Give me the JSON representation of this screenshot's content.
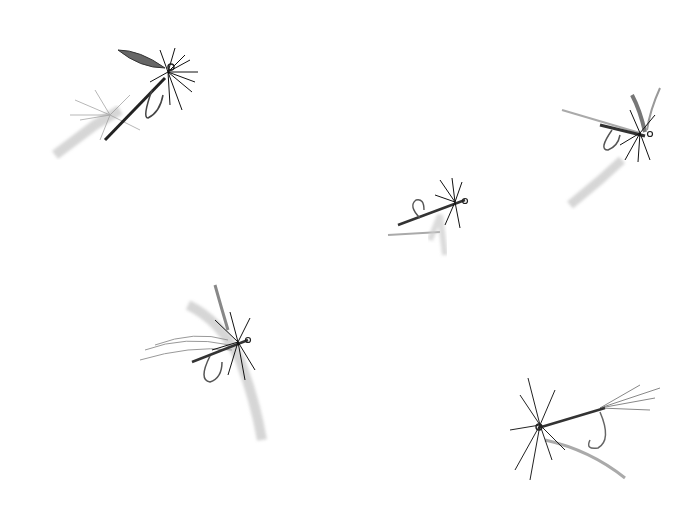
{
  "image": {
    "description": "Five hand-drawn grayscale fishing flies on a white background",
    "background": "#ffffff",
    "ink": "#1a1a1a",
    "flies": [
      {
        "name": "fly-top-left",
        "x": 120,
        "y": 95
      },
      {
        "name": "fly-top-right",
        "x": 610,
        "y": 145
      },
      {
        "name": "fly-center",
        "x": 430,
        "y": 215
      },
      {
        "name": "fly-bottom-left",
        "x": 215,
        "y": 360
      },
      {
        "name": "fly-bottom-right",
        "x": 580,
        "y": 420
      }
    ]
  }
}
